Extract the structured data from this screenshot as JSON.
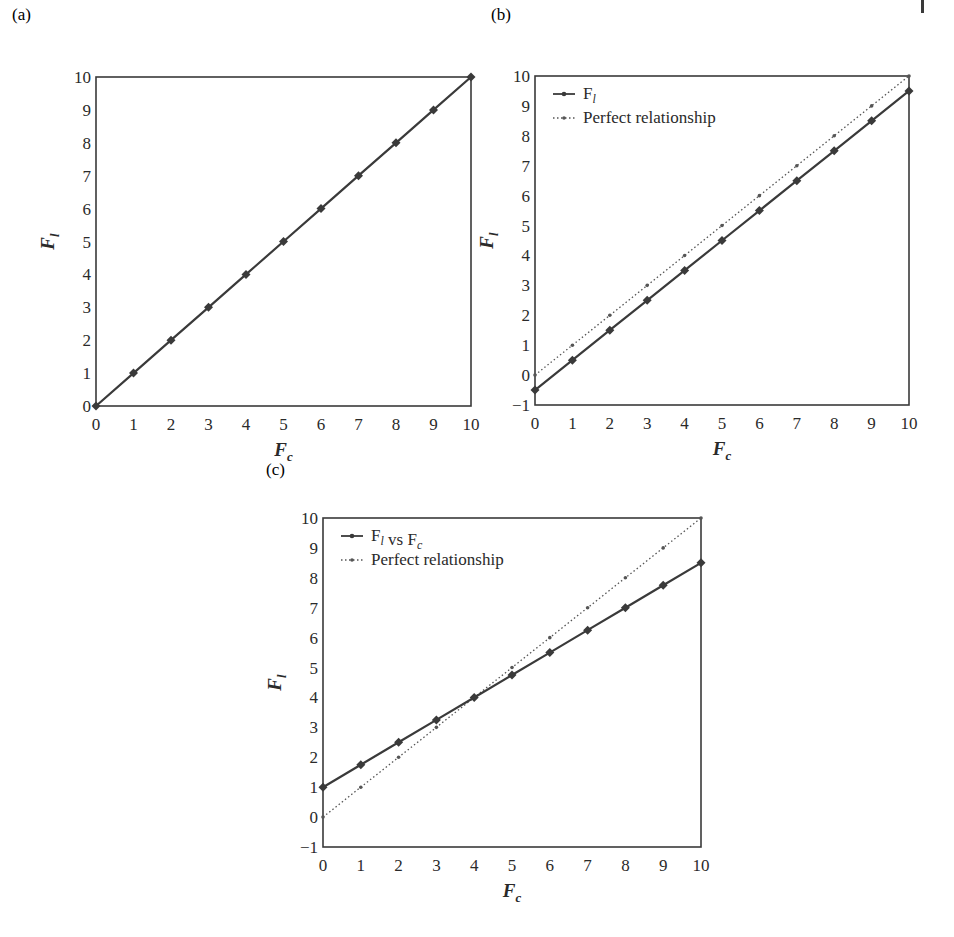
{
  "page_mark": true,
  "colors": {
    "line": "#3a3a3a",
    "frame": "#3a3a3a",
    "dotted": "#555555"
  },
  "panels": [
    {
      "id": "a",
      "label": "(a)"
    },
    {
      "id": "b",
      "label": "(b)"
    },
    {
      "id": "c",
      "label": "(c)"
    }
  ],
  "chart_data": [
    {
      "panel": "(a)",
      "type": "line",
      "xlabel": "F_c",
      "ylabel": "F_l",
      "xlim": [
        0,
        10
      ],
      "ylim": [
        0,
        10
      ],
      "xticks": [
        0,
        1,
        2,
        3,
        4,
        5,
        6,
        7,
        8,
        9,
        10
      ],
      "yticks": [
        0,
        1,
        2,
        3,
        4,
        5,
        6,
        7,
        8,
        9,
        10
      ],
      "grid": false,
      "legend": null,
      "x": [
        0,
        1,
        2,
        3,
        4,
        5,
        6,
        7,
        8,
        9,
        10
      ],
      "series": [
        {
          "name": "F_l",
          "style": "solid",
          "marker": "diamond",
          "values": [
            0,
            1,
            2,
            3,
            4,
            5,
            6,
            7,
            8,
            9,
            10
          ]
        }
      ]
    },
    {
      "panel": "(b)",
      "type": "line",
      "xlabel": "F_c",
      "ylabel": "F_l",
      "xlim": [
        0,
        10
      ],
      "ylim": [
        -1,
        10
      ],
      "xticks": [
        0,
        1,
        2,
        3,
        4,
        5,
        6,
        7,
        8,
        9,
        10
      ],
      "yticks": [
        -1,
        0,
        1,
        2,
        3,
        4,
        5,
        6,
        7,
        8,
        9,
        10
      ],
      "grid": false,
      "legend": {
        "position": "upper left",
        "entries": [
          "F_l",
          "Perfect relationship"
        ]
      },
      "x": [
        0,
        1,
        2,
        3,
        4,
        5,
        6,
        7,
        8,
        9,
        10
      ],
      "series": [
        {
          "name": "F_l",
          "style": "solid",
          "marker": "diamond",
          "values": [
            -0.5,
            0.5,
            1.5,
            2.5,
            3.5,
            4.5,
            5.5,
            6.5,
            7.5,
            8.5,
            9.5
          ]
        },
        {
          "name": "Perfect relationship",
          "style": "dotted",
          "marker": "dot",
          "values": [
            0,
            1,
            2,
            3,
            4,
            5,
            6,
            7,
            8,
            9,
            10
          ]
        }
      ]
    },
    {
      "panel": "(c)",
      "type": "line",
      "xlabel": "F_c",
      "ylabel": "F_l",
      "xlim": [
        0,
        10
      ],
      "ylim": [
        -1,
        10
      ],
      "xticks": [
        0,
        1,
        2,
        3,
        4,
        5,
        6,
        7,
        8,
        9,
        10
      ],
      "yticks": [
        -1,
        0,
        1,
        2,
        3,
        4,
        5,
        6,
        7,
        8,
        9,
        10
      ],
      "grid": false,
      "legend": {
        "position": "upper left",
        "entries": [
          "F_l vs F_c",
          "Perfect relationship"
        ]
      },
      "x": [
        0,
        1,
        2,
        3,
        4,
        5,
        6,
        7,
        8,
        9,
        10
      ],
      "series": [
        {
          "name": "F_l vs F_c",
          "style": "solid",
          "marker": "diamond",
          "values": [
            1,
            1.75,
            2.5,
            3.25,
            4,
            4.75,
            5.5,
            6.25,
            7,
            7.75,
            8.5
          ]
        },
        {
          "name": "Perfect relationship",
          "style": "dotted",
          "marker": "dot",
          "values": [
            0,
            1,
            2,
            3,
            4,
            5,
            6,
            7,
            8,
            9,
            10
          ]
        }
      ]
    }
  ],
  "layout": [
    {
      "left": 96,
      "top": 77,
      "right": 471,
      "bottom": 406,
      "label_x": 12,
      "label_y": 2
    },
    {
      "left": 535,
      "top": 76,
      "right": 909,
      "bottom": 405,
      "label_x": 491,
      "label_y": 2
    },
    {
      "left": 323,
      "top": 518,
      "right": 701,
      "bottom": 847,
      "label_x": 266,
      "label_y": 457
    }
  ]
}
